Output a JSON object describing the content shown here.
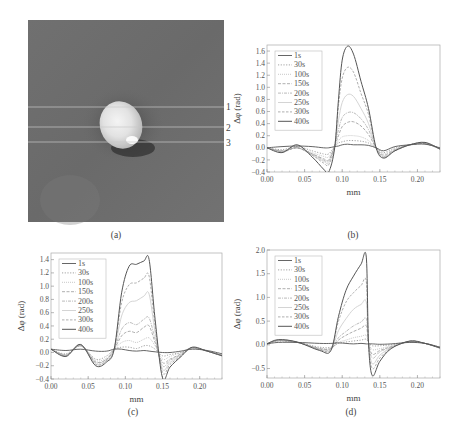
{
  "figure": {
    "panel_a": {
      "caption": "(a)",
      "description": "grayscale phase image with bright elliptical spot, three horizontal profile lines",
      "line_labels": [
        "1",
        "2",
        "3"
      ]
    },
    "panel_b": {
      "caption": "(b)"
    },
    "panel_c": {
      "caption": "(c)"
    },
    "panel_d": {
      "caption": "(d)"
    }
  },
  "legend": [
    "1s",
    "30s",
    "100s",
    "150s",
    "200s",
    "250s",
    "300s",
    "400s"
  ],
  "chart_data": [
    {
      "panel": "b",
      "type": "line",
      "title": "",
      "xlabel": "mm",
      "ylabel": "Δφ (rad)",
      "xlim": [
        0.0,
        0.23
      ],
      "ylim": [
        -0.4,
        1.7
      ],
      "xticks": [
        "0.00",
        "0.05",
        "0.10",
        "0.15",
        "0.20"
      ],
      "yticks": [
        "-0.4",
        "-0.2",
        "0.0",
        "0.2",
        "0.4",
        "0.6",
        "0.8",
        "1.0",
        "1.2",
        "1.4",
        "1.6"
      ],
      "legend_position": "upper-left",
      "x": [
        0.0,
        0.02,
        0.04,
        0.06,
        0.075,
        0.082,
        0.09,
        0.095,
        0.1,
        0.107,
        0.115,
        0.125,
        0.135,
        0.145,
        0.155,
        0.17,
        0.19,
        0.21,
        0.23
      ],
      "series": [
        {
          "name": "1s",
          "values": [
            0.0,
            0.02,
            0.03,
            0.02,
            0.0,
            0.0,
            0.02,
            0.03,
            0.05,
            0.06,
            0.05,
            0.05,
            0.04,
            0.0,
            -0.05,
            0.02,
            0.05,
            0.06,
            0.0
          ]
        },
        {
          "name": "30s",
          "values": [
            0.0,
            -0.03,
            0.02,
            -0.05,
            -0.1,
            -0.1,
            0.02,
            0.08,
            0.1,
            0.12,
            0.12,
            0.11,
            0.08,
            0.0,
            -0.08,
            0.0,
            0.05,
            0.07,
            -0.02
          ]
        },
        {
          "name": "100s",
          "values": [
            0.0,
            -0.05,
            0.0,
            -0.08,
            -0.14,
            -0.15,
            0.02,
            0.12,
            0.18,
            0.2,
            0.2,
            0.18,
            0.12,
            0.0,
            -0.1,
            -0.02,
            0.05,
            0.07,
            -0.02
          ]
        },
        {
          "name": "150s",
          "values": [
            0.0,
            -0.05,
            0.0,
            -0.1,
            -0.18,
            -0.2,
            0.03,
            0.2,
            0.35,
            0.42,
            0.43,
            0.36,
            0.22,
            0.0,
            -0.12,
            -0.03,
            0.05,
            0.07,
            -0.02
          ]
        },
        {
          "name": "200s",
          "values": [
            0.0,
            -0.06,
            0.0,
            -0.1,
            -0.2,
            -0.22,
            0.03,
            0.3,
            0.5,
            0.58,
            0.58,
            0.48,
            0.3,
            0.0,
            -0.14,
            -0.04,
            0.05,
            0.07,
            -0.02
          ]
        },
        {
          "name": "250s",
          "values": [
            0.0,
            -0.06,
            0.0,
            -0.12,
            -0.22,
            -0.25,
            0.03,
            0.45,
            0.75,
            0.88,
            0.85,
            0.65,
            0.4,
            0.0,
            -0.15,
            -0.05,
            0.05,
            0.08,
            -0.02
          ]
        },
        {
          "name": "300s",
          "values": [
            0.0,
            -0.07,
            0.0,
            -0.12,
            -0.25,
            -0.28,
            0.03,
            0.7,
            1.15,
            1.33,
            1.25,
            0.9,
            0.55,
            0.0,
            -0.16,
            -0.05,
            0.05,
            0.08,
            -0.02
          ]
        },
        {
          "name": "400s",
          "values": [
            0.0,
            -0.08,
            0.05,
            -0.15,
            -0.35,
            -0.4,
            0.0,
            0.8,
            1.45,
            1.68,
            1.55,
            1.1,
            0.65,
            0.0,
            -0.17,
            -0.05,
            0.05,
            0.09,
            -0.02
          ]
        }
      ]
    },
    {
      "panel": "c",
      "type": "line",
      "title": "",
      "xlabel": "mm",
      "ylabel": "Δφ (rad)",
      "xlim": [
        0.0,
        0.23
      ],
      "ylim": [
        -0.4,
        1.5
      ],
      "xticks": [
        "0.00",
        "0.05",
        "0.10",
        "0.15",
        "0.20"
      ],
      "yticks": [
        "-0.4",
        "-0.2",
        "0.0",
        "0.2",
        "0.4",
        "0.6",
        "0.8",
        "1.0",
        "1.2",
        "1.4"
      ],
      "legend_position": "upper-left",
      "x": [
        0.0,
        0.02,
        0.04,
        0.06,
        0.075,
        0.085,
        0.095,
        0.105,
        0.115,
        0.125,
        0.132,
        0.14,
        0.15,
        0.16,
        0.175,
        0.19,
        0.21,
        0.23
      ],
      "series": [
        {
          "name": "1s",
          "values": [
            0.05,
            0.03,
            0.05,
            0.02,
            0.02,
            0.05,
            0.05,
            0.03,
            0.02,
            0.03,
            0.02,
            0.01,
            0.0,
            0.0,
            0.02,
            0.05,
            0.03,
            -0.02
          ]
        },
        {
          "name": "30s",
          "values": [
            0.05,
            -0.02,
            0.1,
            -0.1,
            -0.05,
            0.05,
            0.08,
            0.08,
            0.06,
            0.1,
            0.1,
            0.05,
            -0.05,
            -0.03,
            0.0,
            0.07,
            0.02,
            -0.04
          ]
        },
        {
          "name": "100s",
          "values": [
            0.05,
            -0.03,
            0.1,
            -0.12,
            -0.08,
            0.05,
            0.15,
            0.18,
            0.15,
            0.2,
            0.22,
            0.1,
            -0.1,
            -0.06,
            0.0,
            0.07,
            0.02,
            -0.04
          ]
        },
        {
          "name": "150s",
          "values": [
            0.05,
            -0.04,
            0.1,
            -0.14,
            -0.1,
            0.05,
            0.25,
            0.32,
            0.3,
            0.38,
            0.4,
            0.15,
            -0.15,
            -0.1,
            -0.02,
            0.07,
            0.02,
            -0.04
          ]
        },
        {
          "name": "200s",
          "values": [
            0.05,
            -0.04,
            0.1,
            -0.15,
            -0.1,
            0.05,
            0.35,
            0.45,
            0.42,
            0.5,
            0.52,
            0.2,
            -0.2,
            -0.12,
            -0.03,
            0.07,
            0.02,
            -0.05
          ]
        },
        {
          "name": "250s",
          "values": [
            0.05,
            -0.05,
            0.12,
            -0.17,
            -0.12,
            0.05,
            0.55,
            0.75,
            0.78,
            0.85,
            0.88,
            0.3,
            -0.25,
            -0.15,
            -0.04,
            0.07,
            0.02,
            -0.05
          ]
        },
        {
          "name": "300s",
          "values": [
            0.05,
            -0.05,
            0.12,
            -0.18,
            -0.12,
            0.05,
            0.75,
            1.02,
            1.05,
            1.12,
            1.15,
            0.4,
            -0.3,
            -0.18,
            -0.05,
            0.07,
            0.02,
            -0.05
          ]
        },
        {
          "name": "400s",
          "values": [
            0.05,
            -0.06,
            0.12,
            -0.2,
            -0.14,
            0.05,
            0.9,
            1.3,
            1.33,
            1.38,
            1.4,
            0.5,
            -0.38,
            -0.22,
            -0.06,
            0.08,
            0.02,
            -0.05
          ]
        }
      ]
    },
    {
      "panel": "d",
      "type": "line",
      "title": "",
      "xlabel": "mm",
      "ylabel": "Δφ (rad)",
      "xlim": [
        0.0,
        0.23
      ],
      "ylim": [
        -0.7,
        2.0
      ],
      "xticks": [
        "0.00",
        "0.05",
        "0.10",
        "0.15",
        "0.20"
      ],
      "yticks": [
        "-0.5",
        "0.0",
        "0.5",
        "1.0",
        "1.5",
        "2.0"
      ],
      "legend_position": "upper-left",
      "x": [
        0.0,
        0.015,
        0.04,
        0.07,
        0.085,
        0.095,
        0.105,
        0.115,
        0.125,
        0.132,
        0.135,
        0.14,
        0.15,
        0.165,
        0.19,
        0.21,
        0.23
      ],
      "series": [
        {
          "name": "1s",
          "values": [
            0.02,
            0.05,
            0.05,
            0.03,
            0.03,
            0.04,
            0.03,
            0.02,
            0.03,
            0.02,
            0.02,
            0.02,
            0.01,
            0.02,
            0.05,
            0.03,
            -0.05
          ]
        },
        {
          "name": "30s",
          "values": [
            0.02,
            0.08,
            0.05,
            -0.05,
            -0.05,
            0.03,
            0.06,
            0.08,
            0.1,
            0.12,
            0.05,
            -0.02,
            -0.02,
            0.0,
            0.06,
            0.03,
            -0.05
          ]
        },
        {
          "name": "100s",
          "values": [
            0.02,
            0.08,
            0.05,
            -0.07,
            -0.07,
            0.05,
            0.1,
            0.15,
            0.18,
            0.2,
            0.05,
            -0.1,
            -0.08,
            -0.02,
            0.06,
            0.03,
            -0.05
          ]
        },
        {
          "name": "150s",
          "values": [
            0.02,
            0.09,
            0.05,
            -0.08,
            -0.08,
            0.1,
            0.2,
            0.28,
            0.35,
            0.4,
            0.05,
            -0.2,
            -0.12,
            -0.04,
            0.07,
            0.03,
            -0.06
          ]
        },
        {
          "name": "200s",
          "values": [
            0.02,
            0.09,
            0.05,
            -0.09,
            -0.09,
            0.15,
            0.28,
            0.4,
            0.48,
            0.55,
            0.05,
            -0.28,
            -0.15,
            -0.05,
            0.07,
            0.03,
            -0.06
          ]
        },
        {
          "name": "250s",
          "values": [
            0.02,
            0.1,
            0.06,
            -0.1,
            -0.1,
            0.3,
            0.55,
            0.75,
            0.85,
            0.9,
            0.05,
            -0.4,
            -0.22,
            -0.06,
            0.07,
            0.03,
            -0.06
          ]
        },
        {
          "name": "300s",
          "values": [
            0.02,
            0.1,
            0.06,
            -0.1,
            -0.1,
            0.5,
            0.9,
            1.1,
            1.25,
            1.33,
            0.05,
            -0.5,
            -0.28,
            -0.07,
            0.08,
            0.03,
            -0.07
          ]
        },
        {
          "name": "400s",
          "values": [
            0.02,
            0.11,
            0.06,
            -0.12,
            -0.12,
            0.6,
            1.15,
            1.45,
            1.7,
            1.85,
            0.05,
            -0.65,
            -0.35,
            -0.08,
            0.08,
            0.03,
            -0.07
          ]
        }
      ]
    }
  ]
}
